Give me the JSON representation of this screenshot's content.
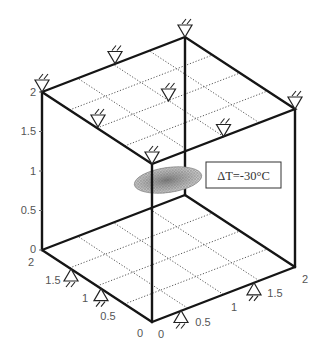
{
  "figure": {
    "annotation": {
      "text": "ΔT=-30°C"
    },
    "axes": {
      "z": {
        "ticks": [
          "0",
          "0.5",
          "1",
          "1.5",
          "2"
        ]
      },
      "y": {
        "ticks": [
          "0",
          "0.5",
          "1",
          "1.5",
          "2"
        ]
      },
      "x": {
        "ticks": [
          "0",
          "0.5",
          "1",
          "1.5",
          "2"
        ]
      }
    },
    "supports": {
      "top_face_count": 8,
      "bottom_edges_count": 4
    },
    "inclusion": {
      "shape": "ellipsoid",
      "rendering": "mesh"
    },
    "colors": {
      "edges": "#151515",
      "grid": "#5a5a5a",
      "labels": "#555555",
      "inclusion": "#8a8a8a"
    }
  }
}
